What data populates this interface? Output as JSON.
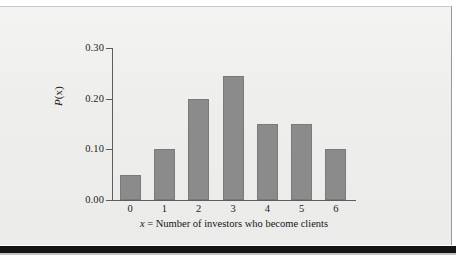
{
  "figure": {
    "panel_background": "#efefee",
    "shadow_color": "#141414",
    "bar_color": "#8b8b8b",
    "bar_edge_color": "#7a7a7a",
    "axis_color": "#5d5d5d",
    "text_color": "#1d1d1d"
  },
  "chart_data": {
    "type": "bar",
    "title": "",
    "subtitle": "",
    "xlabel": "x = Number of investors who become clients",
    "xlabel_variable": "x",
    "xlabel_rest": " = Number of investors who become clients",
    "ylabel": "P(x)",
    "ylabel_function": "P",
    "ylabel_arg": "(x)",
    "categories": [
      "0",
      "1",
      "2",
      "3",
      "4",
      "5",
      "6"
    ],
    "values": [
      0.05,
      0.1,
      0.2,
      0.245,
      0.15,
      0.15,
      0.1
    ],
    "ylim": [
      0.0,
      0.3
    ],
    "xlim": [
      -0.5,
      6.5
    ],
    "yticks": [
      "0.00",
      "0.10",
      "0.20",
      "0.30"
    ],
    "ytick_values": [
      0.0,
      0.1,
      0.2,
      0.3
    ],
    "xticks": [
      "0",
      "1",
      "2",
      "3",
      "4",
      "5",
      "6"
    ],
    "grid": false,
    "legend": null,
    "legend_position": "none",
    "annotations": []
  }
}
